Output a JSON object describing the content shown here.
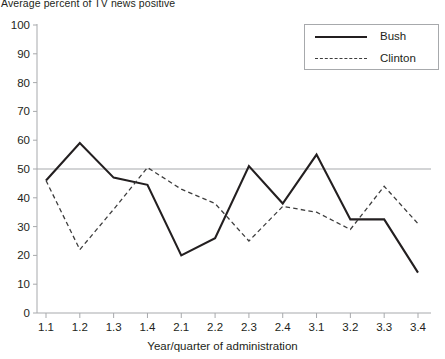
{
  "chart_data": {
    "type": "line",
    "title": "Average percent of TV news positive",
    "xlabel": "Year/quarter of administration",
    "ylabel": "",
    "categories": [
      "1.1",
      "1.2",
      "1.3",
      "1.4",
      "2.1",
      "2.2",
      "2.3",
      "2.4",
      "3.1",
      "3.2",
      "3.3",
      "3.4"
    ],
    "series": [
      {
        "name": "Bush",
        "style": "solid",
        "color": "#231f20",
        "values": [
          46,
          59,
          47,
          44.5,
          20,
          26,
          51,
          38,
          55,
          32.5,
          32.5,
          14
        ]
      },
      {
        "name": "Clinton",
        "style": "dashed",
        "color": "#3d3d3d",
        "values": [
          46,
          22,
          36,
          50.5,
          43,
          38,
          25,
          37,
          35,
          29,
          44,
          31
        ]
      }
    ],
    "ylim": [
      0,
      100
    ],
    "yticks": [
      0,
      10,
      20,
      30,
      40,
      50,
      60,
      70,
      80,
      90,
      100
    ],
    "ytick_labels": [
      "0",
      "10",
      "20",
      "30",
      "40",
      "50",
      "60",
      "70",
      "80",
      "90",
      "100"
    ],
    "reference_line": {
      "value": 50,
      "color": "#a7a9ac"
    },
    "grid": false,
    "legend": {
      "position": "top-right",
      "entries": [
        {
          "label": "Bush",
          "style": "solid"
        },
        {
          "label": "Clinton",
          "style": "dashed"
        }
      ]
    },
    "axis_color": "#a7a9ac"
  }
}
